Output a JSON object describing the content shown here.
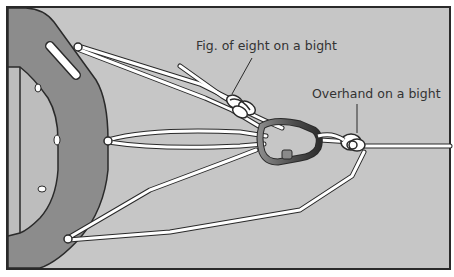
{
  "diagram": {
    "labels": {
      "fig_eight": "Fig. of eight on a bight",
      "overhand": "Overhand on a bight"
    },
    "colors": {
      "background": "#c6c6c6",
      "frame": "#2a2a2a",
      "device": "#8c8c8c",
      "device_inner": "#bdbdbd",
      "rope": "#ffffff",
      "rope_outline": "#2a2a2a",
      "carabiner": "#555555"
    }
  }
}
